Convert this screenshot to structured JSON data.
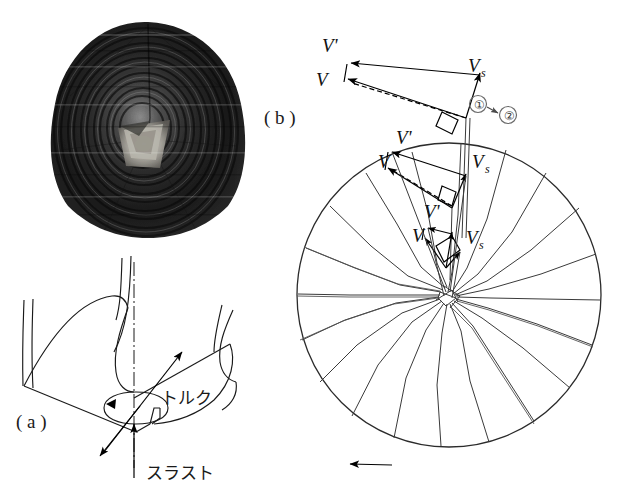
{
  "figure": {
    "background_color": "#ffffff",
    "ink_color": "#1a1a1a",
    "panels": [
      {
        "id": "a",
        "caption": "( a )"
      },
      {
        "id": "b",
        "caption": "( b )"
      }
    ]
  },
  "panel_a": {
    "caption": "( a )",
    "description_labels": {
      "torque": "トルク",
      "thrust": "スラスト"
    },
    "axis_style": "dash-dot centerline",
    "rotation_indicator": "ellipse-arrow"
  },
  "panel_b": {
    "caption": "( b )",
    "rotor": {
      "blade_count": 20,
      "rotation_arrow": "leftward",
      "rim_color": "#2b2b2b"
    },
    "station_markers": [
      {
        "label": "①",
        "name": "station-one"
      },
      {
        "label": "②",
        "name": "station-two"
      }
    ],
    "velocity_triangles": [
      {
        "station": "tip",
        "labels": {
          "v_prime": "V'",
          "v": "V",
          "vs": "V",
          "vs_sub": "s"
        }
      },
      {
        "station": "mid",
        "labels": {
          "v_prime": "V'",
          "v": "V",
          "vs": "V",
          "vs_sub": "s"
        }
      },
      {
        "station": "hub",
        "labels": {
          "v_prime": "V'",
          "v": "V",
          "vs": "V",
          "vs_sub": "s"
        }
      }
    ]
  },
  "photo": {
    "name": "shell-specimen-photograph",
    "subject": "rounded triangular shell with concentric growth rings",
    "tone": "grayscale"
  }
}
